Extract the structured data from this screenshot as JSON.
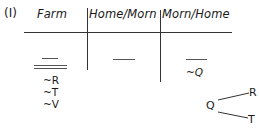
{
  "figure": {
    "label": "(I)",
    "table": {
      "columns": [
        {
          "header": "Farm",
          "slots": [
            "single",
            "double"
          ],
          "annotations": [
            "~R",
            "~T",
            "~V"
          ]
        },
        {
          "header": "Home/Morn",
          "slots": [
            "single"
          ],
          "annotations": []
        },
        {
          "header": "Morn/Home",
          "slots": [
            "single"
          ],
          "annotations": [
            "~Q"
          ]
        }
      ]
    },
    "tree": {
      "root": "Q",
      "branches": [
        "R",
        "T"
      ]
    }
  }
}
